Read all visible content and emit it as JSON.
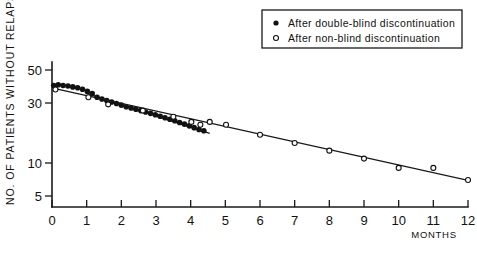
{
  "chart_data": {
    "type": "scatter",
    "title": "",
    "xlabel": "MONTHS",
    "ylabel": "NO. OF PATIENTS WITHOUT RELAPSE",
    "yscale": "log",
    "xlim": [
      0,
      12
    ],
    "ylim": [
      4.2,
      60
    ],
    "grid": false,
    "x_ticks": [
      0,
      1,
      2,
      3,
      4,
      5,
      6,
      7,
      8,
      9,
      10,
      11,
      12
    ],
    "x_tick_labels": [
      "0",
      "1",
      "2",
      "3",
      "4",
      "5",
      "6",
      "7",
      "8",
      "9",
      "10",
      "11",
      "12"
    ],
    "y_ticks": [
      5,
      10,
      30,
      50
    ],
    "y_tick_labels": [
      "5",
      "10",
      "30",
      "50"
    ],
    "legend_position": "top-right",
    "legend": [
      {
        "marker": "filled-circle",
        "label": "After double-blind discontinuation"
      },
      {
        "marker": "open-circle",
        "label": "After non-blind discontinuation"
      }
    ],
    "series": [
      {
        "name": "After double-blind discontinuation",
        "marker": "filled-circle",
        "points": [
          [
            0.05,
            39.0
          ],
          [
            0.18,
            39.5
          ],
          [
            0.32,
            39.0
          ],
          [
            0.46,
            38.6
          ],
          [
            0.6,
            38.0
          ],
          [
            0.74,
            37.4
          ],
          [
            0.88,
            36.4
          ],
          [
            1.02,
            35.0
          ],
          [
            1.16,
            33.6
          ],
          [
            1.3,
            31.4
          ],
          [
            1.44,
            30.4
          ],
          [
            1.58,
            29.6
          ],
          [
            1.72,
            28.8
          ],
          [
            1.86,
            28.0
          ],
          [
            2.0,
            27.2
          ],
          [
            2.14,
            26.4
          ],
          [
            2.28,
            25.8
          ],
          [
            2.42,
            25.2
          ],
          [
            2.56,
            24.6
          ],
          [
            2.7,
            24.0
          ],
          [
            2.84,
            23.4
          ],
          [
            2.98,
            22.8
          ],
          [
            3.12,
            22.2
          ],
          [
            3.26,
            21.6
          ],
          [
            3.4,
            21.0
          ],
          [
            3.54,
            20.4
          ],
          [
            3.68,
            19.8
          ],
          [
            3.82,
            19.2
          ],
          [
            3.96,
            18.6
          ],
          [
            4.1,
            18.0
          ],
          [
            4.24,
            17.4
          ],
          [
            4.38,
            17.0
          ]
        ],
        "fit_line": {
          "x0": 1.02,
          "y0": 33.6,
          "x1": 4.55,
          "y1": 16.2
        }
      },
      {
        "name": "After non-blind discontinuation",
        "marker": "open-circle",
        "points": [
          [
            0.1,
            36.2
          ],
          [
            1.05,
            31.4
          ],
          [
            1.62,
            27.6
          ],
          [
            2.62,
            24.6
          ],
          [
            3.5,
            22.0
          ],
          [
            4.02,
            20.0
          ],
          [
            4.28,
            19.0
          ],
          [
            4.55,
            20.0
          ],
          [
            5.02,
            19.0
          ],
          [
            6.0,
            15.8
          ],
          [
            7.0,
            13.6
          ],
          [
            8.0,
            11.8
          ],
          [
            9.0,
            10.2
          ],
          [
            10.0,
            8.6
          ],
          [
            11.0,
            8.6
          ],
          [
            12.0,
            6.9
          ]
        ],
        "fit_line": {
          "x0": 0.12,
          "y0": 36.6,
          "x1": 12.0,
          "y1": 6.85
        }
      }
    ]
  }
}
